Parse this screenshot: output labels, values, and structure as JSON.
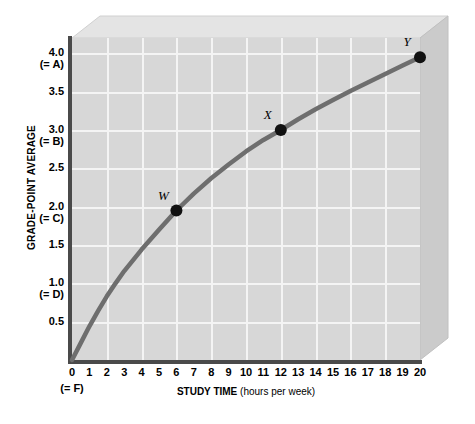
{
  "chart_data": {
    "type": "line",
    "title": "",
    "xlabel": "STUDY TIME (hours per week)",
    "ylabel": "GRADE-POINT AVERAGE",
    "xlim": [
      0,
      20
    ],
    "ylim": [
      0,
      4.2
    ],
    "grid": true,
    "legend": "none",
    "x_tick_labels": [
      "0",
      "1",
      "2",
      "3",
      "4",
      "5",
      "6",
      "7",
      "8",
      "9",
      "10",
      "11",
      "12",
      "13",
      "14",
      "15",
      "16",
      "17",
      "18",
      "19",
      "20"
    ],
    "x_tick_sublabels": [
      "(= F)",
      "",
      "",
      "",
      "",
      "",
      "",
      "",
      "",
      "",
      "",
      "",
      "",
      "",
      "",
      "",
      "",
      "",
      "",
      "",
      ""
    ],
    "y_tick_values": [
      0.5,
      1.0,
      1.5,
      2.0,
      2.5,
      3.0,
      3.5,
      4.0
    ],
    "y_tick_labels": [
      "0.5",
      "1.0",
      "1.5",
      "2.0",
      "2.5",
      "3.0",
      "3.5",
      "4.0"
    ],
    "y_tick_sublabels": [
      "",
      "(= D)",
      "",
      "(= C)",
      "",
      "(= B)",
      "",
      "(= A)"
    ],
    "series": [
      {
        "name": "GPA vs study time",
        "color": "#6e6e6e",
        "x": [
          0.0,
          0.5,
          1.0,
          1.5,
          2.0,
          2.5,
          3.0,
          4.0,
          5.0,
          6.0,
          7.0,
          8.0,
          9.0,
          10.0,
          11.0,
          12.0,
          13.0,
          14.0,
          15.0,
          16.0,
          17.0,
          18.0,
          19.0,
          20.0
        ],
        "y": [
          0.0,
          0.22,
          0.44,
          0.64,
          0.83,
          1.0,
          1.16,
          1.44,
          1.7,
          1.95,
          2.17,
          2.37,
          2.55,
          2.72,
          2.87,
          3.0,
          3.14,
          3.27,
          3.39,
          3.51,
          3.62,
          3.73,
          3.84,
          3.95
        ]
      }
    ],
    "points": [
      {
        "label": "W",
        "x": 6,
        "y": 1.95
      },
      {
        "label": "X",
        "x": 12,
        "y": 3.0
      },
      {
        "label": "Y",
        "x": 20,
        "y": 3.95
      }
    ],
    "colors": {
      "plot_background": "#d7d7d7",
      "gridline": "#f4f4f4",
      "axis": "#4a4a4a",
      "curve": "#6e6e6e",
      "point": "#111111",
      "slab_top": "#e3e3e3",
      "slab_side": "#c8c8c8"
    }
  }
}
